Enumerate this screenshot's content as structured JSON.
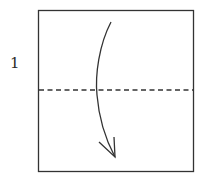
{
  "diagram": {
    "type": "origami-instruction",
    "step_number": "1",
    "paper": {
      "shape": "square",
      "x": 38,
      "y": 10,
      "width": 155,
      "height": 161
    },
    "fold": {
      "type": "valley-fold",
      "line_style": "dashed",
      "orientation": "horizontal",
      "y": 90
    },
    "arrow": {
      "direction": "down",
      "style": "curved",
      "from": [
        111,
        22
      ],
      "to": [
        115,
        157
      ]
    },
    "colors": {
      "line": "#333333",
      "background": "#ffffff"
    }
  }
}
